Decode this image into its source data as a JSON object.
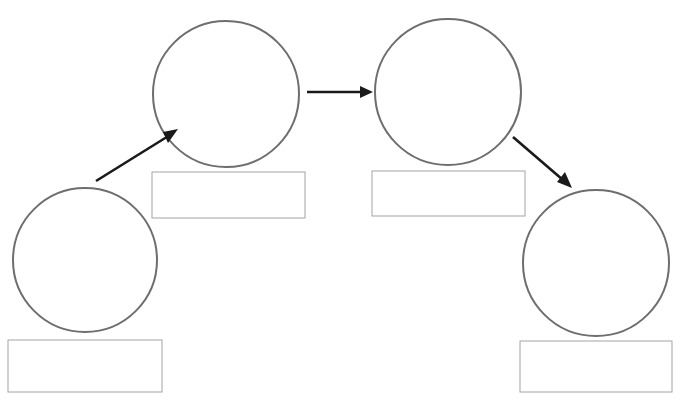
{
  "canvas": {
    "width": 685,
    "height": 405,
    "background": "#ffffff"
  },
  "heading": {
    "text": "",
    "note": "text row clipped at top edge of image, illegible",
    "x": 432,
    "y": -9,
    "width": 215,
    "height": 14
  },
  "style": {
    "circle_stroke": "#6e6e6e",
    "circle_stroke_width": 2,
    "circle_fill": "#ffffff",
    "rect_stroke": "#a3a3a3",
    "rect_stroke_width": 1,
    "rect_fill": "#ffffff",
    "arrow_color": "#1a1a1a",
    "arrow_stroke_width": 2.6
  },
  "diagram": {
    "type": "flow-diagram",
    "title": "",
    "nodes": [
      {
        "id": "node-1",
        "name": "stage-one",
        "circle_label": "",
        "box_label": "",
        "circle": {
          "cx": 85,
          "cy": 260,
          "r": 72
        },
        "box": {
          "x": 8,
          "y": 340,
          "width": 154,
          "height": 52
        }
      },
      {
        "id": "node-2",
        "name": "stage-two",
        "circle_label": "",
        "box_label": "",
        "circle": {
          "cx": 226,
          "cy": 94,
          "r": 73
        },
        "box": {
          "x": 152,
          "y": 172,
          "width": 153,
          "height": 46
        }
      },
      {
        "id": "node-3",
        "name": "stage-three",
        "circle_label": "",
        "box_label": "",
        "circle": {
          "cx": 448,
          "cy": 92,
          "r": 73
        },
        "box": {
          "x": 372,
          "y": 171,
          "width": 153,
          "height": 45
        }
      },
      {
        "id": "node-4",
        "name": "stage-four",
        "circle_label": "",
        "box_label": "",
        "circle": {
          "cx": 596,
          "cy": 263,
          "r": 73
        },
        "box": {
          "x": 520,
          "y": 341,
          "width": 152,
          "height": 51
        }
      }
    ],
    "arrows": [
      {
        "id": "arrow-1",
        "name": "arrow-stage-one-to-stage-two",
        "from": "node-1",
        "to": "node-2",
        "label": "",
        "direction": "up-right",
        "x1": 96,
        "y1": 181,
        "x2": 177,
        "y2": 130
      },
      {
        "id": "arrow-2",
        "name": "arrow-stage-two-to-stage-three",
        "from": "node-2",
        "to": "node-3",
        "label": "",
        "direction": "right",
        "x1": 307,
        "y1": 92,
        "x2": 372,
        "y2": 92
      },
      {
        "id": "arrow-3",
        "name": "arrow-stage-three-to-stage-four",
        "from": "node-3",
        "to": "node-4",
        "label": "",
        "direction": "down-right",
        "x1": 513,
        "y1": 137,
        "x2": 570,
        "y2": 186
      }
    ]
  }
}
